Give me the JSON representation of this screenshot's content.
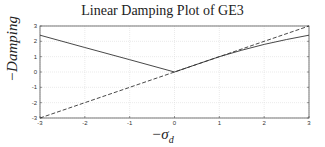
{
  "chart_data": {
    "type": "line",
    "title": "Linear Damping Plot of GE3",
    "xlabel": "−σ_d",
    "xlabel_display": "−σ",
    "xlabel_sub": "d",
    "ylabel": "−Damping",
    "xlim": [
      -3,
      3
    ],
    "ylim": [
      -3,
      3
    ],
    "xticks": [
      -3,
      -2,
      -1,
      0,
      1,
      2,
      3
    ],
    "yticks": [
      -3,
      -2,
      -1,
      0,
      1,
      2,
      3
    ],
    "grid": true,
    "legend": null,
    "series": [
      {
        "name": "damping",
        "style": "solid",
        "x": [
          -3,
          -2,
          -1,
          0,
          0.5,
          1,
          1.5,
          2,
          2.5,
          3
        ],
        "y": [
          2.4,
          1.6,
          0.8,
          0,
          0.5,
          1.0,
          1.42,
          1.8,
          2.12,
          2.4
        ]
      },
      {
        "name": "reference y=x",
        "style": "dashed",
        "x": [
          -3,
          3
        ],
        "y": [
          -3,
          3
        ]
      }
    ]
  },
  "colors": {
    "line": "#333333",
    "grid": "#dddddd",
    "axis": "#555555"
  }
}
